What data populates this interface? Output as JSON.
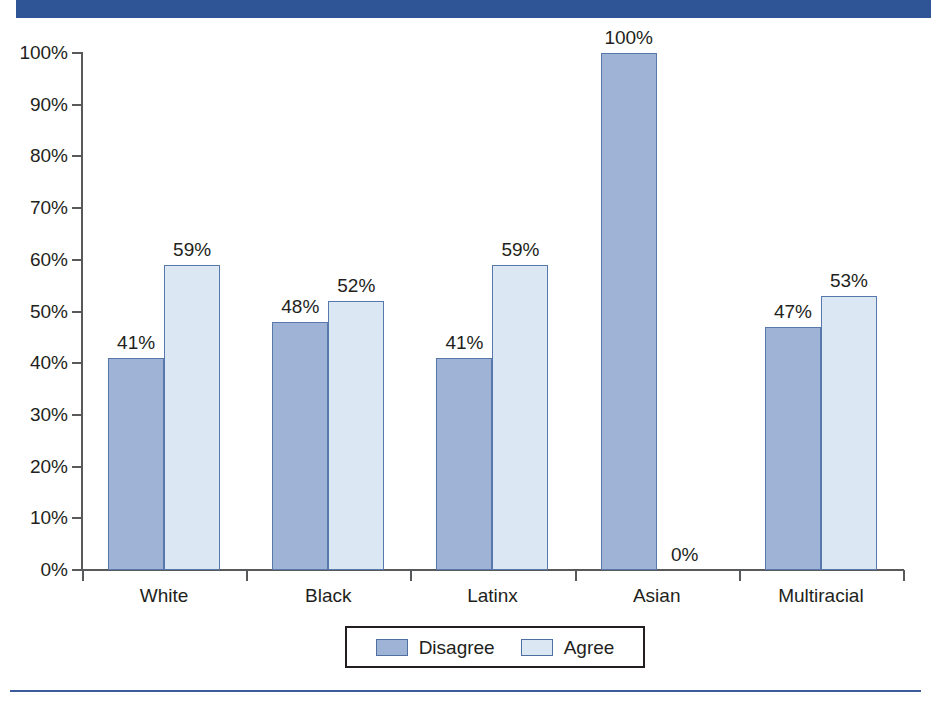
{
  "chart_data": {
    "type": "bar",
    "title": "",
    "subtitle": "",
    "xlabel": "",
    "ylabel": "",
    "ylim": [
      0,
      100
    ],
    "grid": false,
    "legend_position": "bottom",
    "categories": [
      "White",
      "Black",
      "Latinx",
      "Asian",
      "Multiracial"
    ],
    "series": [
      {
        "name": "Disagree",
        "color": "#9eb3d5",
        "values": [
          41,
          48,
          41,
          100,
          47
        ],
        "labels": [
          "41%",
          "48%",
          "41%",
          "100%",
          "47%"
        ]
      },
      {
        "name": "Agree",
        "color": "#dce7f4",
        "values": [
          59,
          52,
          59,
          0,
          53
        ],
        "labels": [
          "59%",
          "52%",
          "59%",
          "0%",
          "53%"
        ]
      }
    ],
    "y_ticks": [
      0,
      10,
      20,
      30,
      40,
      50,
      60,
      70,
      80,
      90,
      100
    ],
    "y_tick_labels": [
      "0%",
      "10%",
      "20%",
      "30%",
      "40%",
      "50%",
      "60%",
      "70%",
      "80%",
      "90%",
      "100%"
    ]
  },
  "legend": {
    "items": [
      {
        "label": "Disagree",
        "swatch": "disagree-swatch"
      },
      {
        "label": "Agree",
        "swatch": "agree-swatch"
      }
    ]
  },
  "decor": {
    "top_band_color": "#2f5597",
    "bottom_rule_color": "#3d5a9a",
    "axis_color": "#58595b",
    "bar_border_color": "#5878ab"
  }
}
